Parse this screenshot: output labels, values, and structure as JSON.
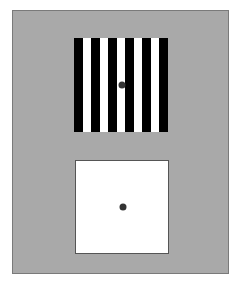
{
  "figure": {
    "background_color": "#a9a9a9",
    "grating": {
      "stripe_count": 11,
      "colors": [
        "#000000",
        "#ffffff"
      ],
      "fixation_dot": true
    },
    "uniform_field": {
      "color": "#ffffff",
      "fixation_dot": true
    },
    "dot_color": "#333333"
  }
}
